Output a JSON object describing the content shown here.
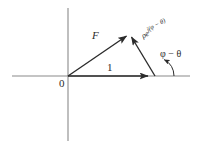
{
  "figure": {
    "background_color": "#ffffff",
    "axis_color": "#8a8a8a",
    "vector_color": "#2b2b2b",
    "label_color": "#2b2b2b",
    "width": 198,
    "height": 148
  },
  "axes": {
    "horizontal": {
      "name": "real-axis",
      "x1": 12,
      "y1": 76,
      "x2": 190,
      "y2": 76
    },
    "vertical": {
      "name": "imaginary-axis",
      "x1": 68,
      "y1": 8,
      "x2": 68,
      "y2": 141
    }
  },
  "labels": {
    "origin": "0",
    "unit_vector": "1",
    "force_vector": "F",
    "rho_mantissa": "ρe",
    "rho_exponent": "j(φ − θ)",
    "angle": "φ − θ"
  },
  "vectors": [
    {
      "name": "unit-vector",
      "label": "1",
      "from": [
        68,
        76
      ],
      "to": [
        155,
        76
      ]
    },
    {
      "name": "force-vector",
      "label": "F",
      "from": [
        68,
        76
      ],
      "to": [
        130,
        33
      ]
    },
    {
      "name": "rho-vector",
      "label": "ρe^{j(φ − θ)}",
      "from": [
        155,
        76
      ],
      "to": [
        130,
        33
      ]
    }
  ],
  "angle_arc": {
    "name": "angle-arc",
    "vertex": [
      155,
      76
    ],
    "label": "φ − θ",
    "radius": 18
  }
}
